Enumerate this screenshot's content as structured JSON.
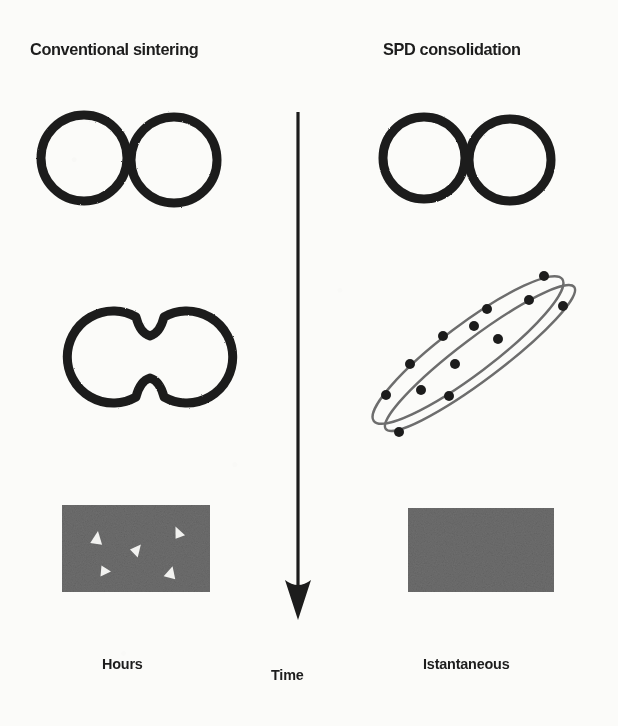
{
  "figure": {
    "kind": "scientific-schematic",
    "background_color": "#fbfbf9",
    "ink_color": "#1d1d1d",
    "gray_fill": "#6e6e6e",
    "columns": {
      "left_title": "Conventional sintering",
      "right_title": "SPD consolidation"
    },
    "footer": {
      "left_label": "Hours",
      "center_label": "Time",
      "right_label": "Istantaneous"
    },
    "time_arrow": {
      "name": "downward time arrow",
      "x": 298,
      "y_start": 112,
      "y_tip": 620,
      "stroke_width": 3,
      "head_width": 26,
      "head_height": 34,
      "color": "#1d1d1d"
    },
    "rows": [
      {
        "stage": "initial loose particles",
        "left_shape": "two tangent open circles",
        "right_shape": "two tangent open circles"
      },
      {
        "stage": "intermediate",
        "left_shape": "coalesced two-lobe neck profile",
        "right_shape": "two overlapping elongated sheared ellipses with dispersed particles"
      },
      {
        "stage": "final microstructure",
        "left_shape": "gray rectangle with residual porosity arrowheads",
        "right_shape": "uniform gray fully dense rectangle"
      }
    ],
    "left_circles": [
      {
        "cx": 84,
        "cy": 158,
        "r": 43,
        "stroke": 9
      },
      {
        "cx": 174,
        "cy": 160,
        "r": 43,
        "stroke": 9
      }
    ],
    "right_circles": [
      {
        "cx": 424,
        "cy": 158,
        "r": 41,
        "stroke": 9
      },
      {
        "cx": 510,
        "cy": 160,
        "r": 41,
        "stroke": 9
      }
    ],
    "neck_shape": {
      "left_cx": 114,
      "left_cy": 357,
      "left_r": 46,
      "right_cx": 158,
      "right_cy": 357,
      "right_r": 46,
      "stroke": 9
    },
    "ellipses": [
      {
        "cx": 468,
        "cy": 350,
        "rx": 118,
        "ry": 25,
        "rotation": -37,
        "stroke": 2
      },
      {
        "cx": 478,
        "cy": 356,
        "rx": 118,
        "ry": 22,
        "rotation": -37,
        "stroke": 2
      }
    ],
    "ellipse_particles": [
      {
        "x": 544,
        "y": 276,
        "r": 5
      },
      {
        "x": 529,
        "y": 300,
        "r": 5
      },
      {
        "x": 563,
        "y": 306,
        "r": 5
      },
      {
        "x": 487,
        "y": 309,
        "r": 5
      },
      {
        "x": 498,
        "y": 339,
        "r": 5
      },
      {
        "x": 443,
        "y": 336,
        "r": 5
      },
      {
        "x": 455,
        "y": 364,
        "r": 5
      },
      {
        "x": 410,
        "y": 364,
        "r": 5
      },
      {
        "x": 421,
        "y": 390,
        "r": 5
      },
      {
        "x": 386,
        "y": 395,
        "r": 5
      },
      {
        "x": 449,
        "y": 396,
        "r": 5
      },
      {
        "x": 399,
        "y": 432,
        "r": 5
      },
      {
        "x": 474,
        "y": 326,
        "r": 5
      }
    ],
    "left_rect": {
      "x": 62,
      "y": 505,
      "width": 148,
      "height": 87,
      "fill": "#6e6e6e",
      "porosity_marks": [
        {
          "x": 97,
          "y": 538,
          "size": 13,
          "rotation": 8
        },
        {
          "x": 137,
          "y": 549,
          "size": 12,
          "rotation": 40
        },
        {
          "x": 178,
          "y": 532,
          "size": 11,
          "rotation": -25
        },
        {
          "x": 106,
          "y": 571,
          "size": 11,
          "rotation": 95
        },
        {
          "x": 171,
          "y": 572,
          "size": 12,
          "rotation": 15
        }
      ]
    },
    "right_rect": {
      "x": 408,
      "y": 508,
      "width": 146,
      "height": 84,
      "fill": "#6e6e6e",
      "porosity_marks": []
    }
  }
}
